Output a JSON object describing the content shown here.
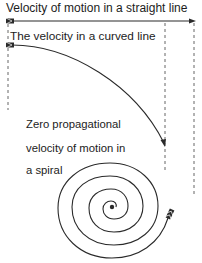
{
  "diagram": {
    "labels": {
      "straight": "Velocity of motion in a straight line",
      "curved": "The velocity in a curved line",
      "spiral_line1": "Zero propagational",
      "spiral_line2": "velocity of motion in",
      "spiral_line3": "a spiral"
    },
    "elements": [
      {
        "id": "straight-arrow",
        "type": "arrow",
        "path": "straight line",
        "direction": "left-to-right"
      },
      {
        "id": "curved-arrow",
        "type": "arrow",
        "path": "downward curve",
        "direction": "left-to-right"
      },
      {
        "id": "spiral-arrow",
        "type": "arrow",
        "path": "inward spiral",
        "direction": "outside-to-center"
      },
      {
        "id": "guide-left",
        "type": "dashed-vertical-line"
      },
      {
        "id": "guide-middle",
        "type": "dashed-vertical-line"
      },
      {
        "id": "guide-right",
        "type": "dashed-vertical-line"
      }
    ],
    "colors": {
      "stroke": "#2a2a2a",
      "dash": "#555555",
      "background": "#ffffff"
    }
  }
}
